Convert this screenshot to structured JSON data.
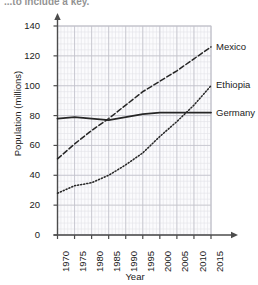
{
  "caption": {
    "text": "...to include a key."
  },
  "chart_data": {
    "type": "line",
    "title": "",
    "xlabel": "Year",
    "ylabel": "Population (millions)",
    "xlim": [
      1970,
      2015
    ],
    "ylim": [
      0,
      140
    ],
    "xticks": [
      "1970",
      "1975",
      "1980",
      "1985",
      "1990",
      "1995",
      "2000",
      "2005",
      "2010",
      "2015"
    ],
    "yticks": [
      "0",
      "20",
      "40",
      "60",
      "80",
      "100",
      "120",
      "140"
    ],
    "grid": true,
    "legend_position": "right-of-plot-inline-labels",
    "x": [
      1970,
      1975,
      1980,
      1985,
      1990,
      1995,
      2000,
      2005,
      2010,
      2015
    ],
    "series": [
      {
        "name": "Mexico",
        "style": "dashed",
        "color": "#262626",
        "values": [
          51,
          61,
          70,
          78,
          87,
          96,
          103,
          110,
          118,
          126
        ]
      },
      {
        "name": "Ethiopia",
        "style": "dotted",
        "color": "#262626",
        "values": [
          28,
          33,
          35,
          40,
          47,
          55,
          66,
          76,
          87,
          100
        ]
      },
      {
        "name": "Germany",
        "style": "solid",
        "color": "#262626",
        "values": [
          78,
          79,
          78,
          77,
          79,
          81,
          82,
          82,
          82,
          82
        ]
      }
    ]
  },
  "axis_colors": {
    "grid_minor": "#e3e3e8",
    "grid_major": "#c2c2ca",
    "axis": "#4c4c4c",
    "plot_bg": "#fbfbfd"
  },
  "series_labels": [
    {
      "name": "Mexico",
      "value": "Mexico"
    },
    {
      "name": "Ethiopia",
      "value": "Ethiopia"
    },
    {
      "name": "Germany",
      "value": "Germany"
    }
  ]
}
